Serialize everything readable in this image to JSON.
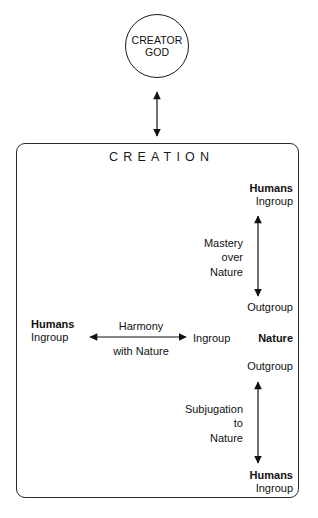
{
  "diagram": {
    "title": "CREATION",
    "creator": {
      "line1": "CREATOR",
      "line2": "GOD"
    },
    "relations": {
      "creator_to_creation": "double-headed-vertical-arrow",
      "mastery": {
        "label_line1": "Mastery",
        "label_line2": "over",
        "label_line3": "Nature",
        "top_strong": "Humans",
        "top_regular": "Ingroup",
        "bottom_regular": "Outgroup",
        "arrow": "double-headed-vertical-arrow"
      },
      "harmony": {
        "label_above": "Harmony",
        "label_below": "with Nature",
        "left_strong": "Humans",
        "left_regular": "Ingroup",
        "right_regular": "Ingroup",
        "arrow": "double-headed-horizontal-arrow"
      },
      "subjugation": {
        "label_line1": "Subjugation",
        "label_line2": "to",
        "label_line3": "Nature",
        "top_regular": "Outgroup",
        "bottom_strong": "Humans",
        "bottom_regular": "Ingroup",
        "arrow": "double-headed-vertical-arrow"
      },
      "nature": {
        "label": "Nature"
      }
    },
    "colors": {
      "ink": "#111111",
      "stroke": "#2a2a2a",
      "background": "#ffffff"
    }
  }
}
